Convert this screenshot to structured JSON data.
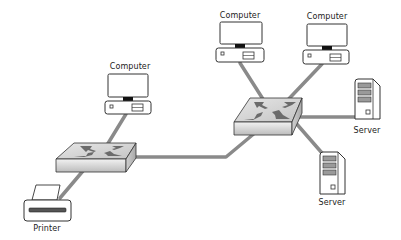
{
  "diagram": {
    "colors": {
      "background": "#ffffff",
      "link": "#8a8a8a",
      "outline": "#333333",
      "switch_top": "#d9d9d9",
      "switch_side": "#bdbdbd",
      "switch_arrows": "#6b6b6b",
      "screen_stand": "#111111"
    },
    "nodes": [
      {
        "id": "computer-1",
        "type": "computer",
        "label": "Computer",
        "x": 128,
        "y": 68
      },
      {
        "id": "computer-2",
        "type": "computer",
        "label": "Computer",
        "x": 241,
        "y": 17
      },
      {
        "id": "computer-3",
        "type": "computer",
        "label": "Computer",
        "x": 327,
        "y": 17
      },
      {
        "id": "switch-1",
        "type": "switch",
        "label": "",
        "x": 96,
        "y": 156
      },
      {
        "id": "switch-2",
        "type": "switch",
        "label": "",
        "x": 267,
        "y": 115
      },
      {
        "id": "server-1",
        "type": "server",
        "label": "Server",
        "x": 367,
        "y": 98
      },
      {
        "id": "server-2",
        "type": "server",
        "label": "Server",
        "x": 332,
        "y": 172
      },
      {
        "id": "printer-1",
        "type": "printer",
        "label": "Printer",
        "x": 46,
        "y": 205
      }
    ],
    "links": [
      {
        "from": "computer-1",
        "to": "switch-1"
      },
      {
        "from": "printer-1",
        "to": "switch-1"
      },
      {
        "from": "switch-1",
        "to": "switch-2"
      },
      {
        "from": "computer-2",
        "to": "switch-2"
      },
      {
        "from": "computer-3",
        "to": "switch-2"
      },
      {
        "from": "switch-2",
        "to": "server-1"
      },
      {
        "from": "switch-2",
        "to": "server-2"
      }
    ],
    "labels": {
      "computer_1": "Computer",
      "computer_2": "Computer",
      "computer_3": "Computer",
      "server_1": "Server",
      "server_2": "Server",
      "printer_1": "Printer"
    }
  }
}
